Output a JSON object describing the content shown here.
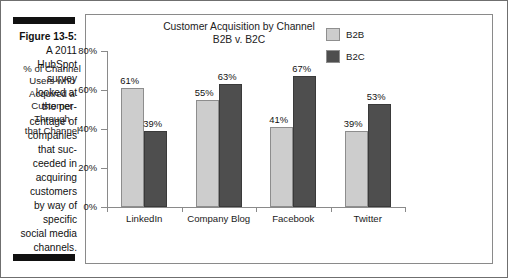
{
  "caption": {
    "figure_number": "Figure 13-5:",
    "lines": [
      "A 2011",
      "HubSpot",
      "survey",
      "looked at",
      "the per-",
      "centage of",
      "companies",
      "that suc-",
      "ceeded in",
      "acquiring",
      "customers",
      "by way of",
      "specific",
      "social media",
      "channels."
    ]
  },
  "chart_data": {
    "type": "bar",
    "title": "Customer Acquisition by Channel",
    "subtitle": "B2B v. B2C",
    "categories": [
      "LinkedIn",
      "Company Blog",
      "Facebook",
      "Twitter"
    ],
    "series": [
      {
        "name": "B2B",
        "color": "#cdcdcd",
        "values": [
          61,
          55,
          41,
          39
        ],
        "labels": [
          "61%",
          "55%",
          "41%",
          "39%"
        ]
      },
      {
        "name": "B2C",
        "color": "#4e4e4e",
        "values": [
          39,
          63,
          67,
          53
        ],
        "labels": [
          "39%",
          "63%",
          "67%",
          "53%"
        ]
      }
    ],
    "xlabel": "",
    "ylabel": "% of Channel Users who Acquired a Customer Through that Channel",
    "ylabel_lines": [
      "% of Channel",
      "Users who",
      "Acquired a",
      "Customer",
      "Through",
      "that Channel"
    ],
    "ylim": [
      0,
      80
    ],
    "yticks": [
      0,
      20,
      40,
      60,
      80
    ],
    "ytick_labels": [
      "0%",
      "20%",
      "40%",
      "60%",
      "80%"
    ],
    "grid": false,
    "legend_position": "top-right",
    "value_labels_shown": true
  }
}
